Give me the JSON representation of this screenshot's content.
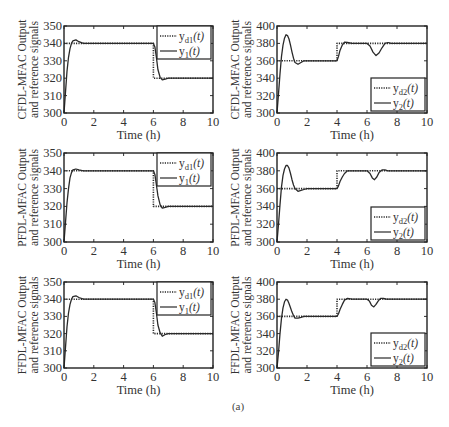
{
  "caption": "(a)",
  "chart_data": [
    {
      "type": "line",
      "id": "cfdl-1",
      "ylabel_lines": [
        "CFDL-MFAC Output",
        "and reference signals"
      ],
      "xlabel": "Time (h)",
      "xlim": [
        0,
        10
      ],
      "ylim": [
        300,
        350
      ],
      "xticks": [
        0,
        2,
        4,
        6,
        8,
        10
      ],
      "yticks": [
        300,
        310,
        320,
        330,
        340,
        350
      ],
      "legend_position": "top-right",
      "series": [
        {
          "name": "y_d1(t)",
          "style": "dotted",
          "x": [
            0,
            6,
            6,
            10
          ],
          "y": [
            340,
            340,
            320,
            320
          ]
        },
        {
          "name": "y_1(t)",
          "style": "solid",
          "x": [
            0,
            0.1,
            0.2,
            0.3,
            0.4,
            0.5,
            0.6,
            0.8,
            1.0,
            1.3,
            6.0,
            6.1,
            6.2,
            6.3,
            6.45,
            6.6,
            6.8,
            7.0,
            10
          ],
          "y": [
            300,
            312,
            324,
            332,
            337,
            340,
            341.5,
            342,
            341,
            340,
            340,
            338,
            332,
            325,
            320.5,
            319,
            319.5,
            320,
            320
          ]
        }
      ]
    },
    {
      "type": "line",
      "id": "cfdl-2",
      "ylabel_lines": [
        "CFDL-MFAC Output",
        "and reference signals"
      ],
      "xlabel": "Time (h)",
      "xlim": [
        0,
        10
      ],
      "ylim": [
        300,
        400
      ],
      "xticks": [
        0,
        2,
        4,
        6,
        8,
        10
      ],
      "yticks": [
        300,
        320,
        340,
        360,
        380,
        400
      ],
      "legend_position": "bottom-right",
      "series": [
        {
          "name": "y_d2(t)",
          "style": "dotted",
          "x": [
            0,
            4,
            4,
            10
          ],
          "y": [
            360,
            360,
            380,
            380
          ]
        },
        {
          "name": "y_2(t)",
          "style": "solid",
          "x": [
            0,
            0.1,
            0.2,
            0.3,
            0.4,
            0.5,
            0.6,
            0.7,
            0.8,
            0.9,
            1.0,
            1.1,
            1.2,
            1.4,
            1.6,
            1.8,
            2.0,
            4.0,
            4.1,
            4.2,
            4.35,
            4.5,
            4.7,
            5.0,
            6.0,
            6.2,
            6.4,
            6.6,
            6.8,
            7.0,
            7.2,
            7.4,
            7.6,
            10
          ],
          "y": [
            300,
            322,
            345,
            365,
            378,
            386,
            390,
            389,
            385,
            378,
            370,
            363,
            358,
            356,
            358,
            360,
            360,
            360,
            365,
            372,
            378,
            381.5,
            381,
            380,
            380,
            377,
            370,
            366,
            369,
            375,
            380,
            381,
            380,
            380
          ]
        }
      ]
    },
    {
      "type": "line",
      "id": "pfdl-1",
      "ylabel_lines": [
        "PFDL-MFAC Output",
        "and reference signals"
      ],
      "xlabel": "Time (h)",
      "xlim": [
        0,
        10
      ],
      "ylim": [
        300,
        350
      ],
      "xticks": [
        0,
        2,
        4,
        6,
        8,
        10
      ],
      "yticks": [
        300,
        310,
        320,
        330,
        340,
        350
      ],
      "legend_position": "top-right",
      "series": [
        {
          "name": "y_d1(t)",
          "style": "dotted",
          "x": [
            0,
            6,
            6,
            10
          ],
          "y": [
            340,
            340,
            320,
            320
          ]
        },
        {
          "name": "y_1(t)",
          "style": "solid",
          "x": [
            0,
            0.1,
            0.2,
            0.3,
            0.4,
            0.5,
            0.6,
            0.8,
            1.0,
            1.3,
            6.0,
            6.1,
            6.2,
            6.3,
            6.45,
            6.6,
            6.8,
            7.0,
            10
          ],
          "y": [
            300,
            311,
            322,
            330,
            336,
            339,
            340.5,
            341,
            340.5,
            340,
            340,
            338,
            332,
            326,
            321,
            319,
            319.5,
            320,
            320
          ]
        }
      ]
    },
    {
      "type": "line",
      "id": "pfdl-2",
      "ylabel_lines": [
        "PFDL-MFAC Output",
        "and reference signals"
      ],
      "xlabel": "Time (h)",
      "xlim": [
        0,
        10
      ],
      "ylim": [
        300,
        400
      ],
      "xticks": [
        0,
        2,
        4,
        6,
        8,
        10
      ],
      "yticks": [
        300,
        320,
        340,
        360,
        380,
        400
      ],
      "legend_position": "bottom-right",
      "series": [
        {
          "name": "y_d2(t)",
          "style": "dotted",
          "x": [
            0,
            4,
            4,
            10
          ],
          "y": [
            360,
            360,
            380,
            380
          ]
        },
        {
          "name": "y_2(t)",
          "style": "solid",
          "x": [
            0,
            0.1,
            0.2,
            0.3,
            0.4,
            0.5,
            0.6,
            0.7,
            0.8,
            0.9,
            1.0,
            1.1,
            1.2,
            1.4,
            1.6,
            1.8,
            2.0,
            4.0,
            4.1,
            4.2,
            4.35,
            4.5,
            4.7,
            5.0,
            6.0,
            6.2,
            6.35,
            6.5,
            6.65,
            6.8,
            7.0,
            7.2,
            7.4,
            10
          ],
          "y": [
            300,
            320,
            342,
            362,
            375,
            382,
            386,
            386,
            383,
            377,
            370,
            364,
            360,
            357,
            358,
            359,
            360,
            360,
            363,
            368,
            373,
            377,
            380,
            380,
            380,
            377,
            372,
            370,
            373,
            378,
            381,
            381,
            380,
            380
          ]
        }
      ]
    },
    {
      "type": "line",
      "id": "ffdl-1",
      "ylabel_lines": [
        "FFDL-MFAC Output",
        "and reference signals"
      ],
      "xlabel": "Time (h)",
      "xlim": [
        0,
        10
      ],
      "ylim": [
        300,
        350
      ],
      "xticks": [
        0,
        2,
        4,
        6,
        8,
        10
      ],
      "yticks": [
        300,
        310,
        320,
        330,
        340,
        350
      ],
      "legend_position": "top-right",
      "series": [
        {
          "name": "y_d1(t)",
          "style": "dotted",
          "x": [
            0,
            6,
            6,
            10
          ],
          "y": [
            340,
            340,
            320,
            320
          ]
        },
        {
          "name": "y_1(t)",
          "style": "solid",
          "x": [
            0,
            0.1,
            0.2,
            0.3,
            0.4,
            0.5,
            0.6,
            0.8,
            1.0,
            1.3,
            6.0,
            6.1,
            6.2,
            6.3,
            6.45,
            6.6,
            6.8,
            7.0,
            10
          ],
          "y": [
            300,
            312,
            324,
            332,
            337,
            340,
            341.5,
            342,
            341,
            340,
            340,
            338,
            332,
            325,
            320.5,
            318.5,
            319.5,
            320,
            320
          ]
        }
      ]
    },
    {
      "type": "line",
      "id": "ffdl-2",
      "ylabel_lines": [
        "FFDL-MFAC Output",
        "and reference signals"
      ],
      "xlabel": "Time (h)",
      "xlim": [
        0,
        10
      ],
      "ylim": [
        300,
        400
      ],
      "xticks": [
        0,
        2,
        4,
        6,
        8,
        10
      ],
      "yticks": [
        300,
        320,
        340,
        360,
        380,
        400
      ],
      "legend_position": "bottom-right",
      "series": [
        {
          "name": "y_d2(t)",
          "style": "dotted",
          "x": [
            0,
            4,
            4,
            10
          ],
          "y": [
            360,
            360,
            380,
            380
          ]
        },
        {
          "name": "y_2(t)",
          "style": "solid",
          "x": [
            0,
            0.1,
            0.2,
            0.3,
            0.4,
            0.5,
            0.6,
            0.7,
            0.8,
            0.9,
            1.0,
            1.1,
            1.2,
            1.4,
            1.6,
            1.8,
            2.0,
            4.0,
            4.1,
            4.2,
            4.35,
            4.5,
            4.7,
            5.0,
            6.0,
            6.15,
            6.3,
            6.45,
            6.6,
            6.75,
            6.9,
            7.1,
            7.3,
            10
          ],
          "y": [
            300,
            318,
            340,
            358,
            370,
            377,
            380,
            379,
            375,
            370,
            365,
            361,
            358,
            358,
            359,
            360,
            360,
            360,
            363,
            368,
            374,
            379,
            381,
            380,
            380,
            378,
            373,
            371,
            374,
            378,
            381,
            381,
            380,
            380
          ]
        }
      ]
    }
  ]
}
